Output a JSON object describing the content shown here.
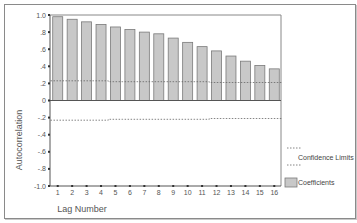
{
  "chart_data": {
    "type": "bar",
    "title": "",
    "xlabel": "Lag Number",
    "ylabel": "Autocorrelation",
    "ylim": [
      -1.0,
      1.0
    ],
    "yticks": [
      "1.0",
      ".8",
      ".6",
      ".4",
      ".2",
      "0",
      "-.2",
      "-.4",
      "-.6",
      "-.8",
      "-1.0"
    ],
    "ytick_values": [
      1.0,
      0.8,
      0.6,
      0.4,
      0.2,
      0.0,
      -0.2,
      -0.4,
      -0.6,
      -0.8,
      -1.0
    ],
    "categories": [
      "1",
      "2",
      "3",
      "4",
      "5",
      "6",
      "7",
      "8",
      "9",
      "10",
      "11",
      "12",
      "13",
      "14",
      "15",
      "16"
    ],
    "series": [
      {
        "name": "Coefficients",
        "type": "bar",
        "color": "#c8c8c8",
        "values": [
          0.98,
          0.95,
          0.92,
          0.89,
          0.86,
          0.83,
          0.8,
          0.78,
          0.73,
          0.68,
          0.63,
          0.58,
          0.52,
          0.46,
          0.41,
          0.37
        ]
      },
      {
        "name": "Confidence Limits (upper)",
        "type": "line",
        "style": "dashed",
        "values": [
          0.23,
          0.23,
          0.23,
          0.23,
          0.22,
          0.22,
          0.22,
          0.22,
          0.22,
          0.22,
          0.22,
          0.21,
          0.21,
          0.21,
          0.21,
          0.21
        ]
      },
      {
        "name": "Confidence Limits (lower)",
        "type": "line",
        "style": "dashed",
        "values": [
          -0.23,
          -0.23,
          -0.23,
          -0.23,
          -0.22,
          -0.22,
          -0.22,
          -0.22,
          -0.22,
          -0.22,
          -0.22,
          -0.21,
          -0.21,
          -0.21,
          -0.21,
          -0.21
        ]
      }
    ],
    "legend": {
      "position": "right",
      "entries": [
        "Confidence Limits",
        "Coefficients"
      ]
    },
    "grid": false
  },
  "labels": {
    "xlabel": "Lag Number",
    "ylabel": "Autocorrelation",
    "legend_confidence": "Confidence Limits",
    "legend_coefficients": "Coefficients"
  },
  "colors": {
    "bar_fill": "#c8c8c8",
    "bar_stroke": "#7a7a7a",
    "axis": "#555555",
    "dash": "#666666"
  }
}
